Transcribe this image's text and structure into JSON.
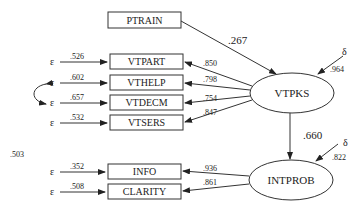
{
  "diagram": {
    "type": "structural-equation-path-diagram",
    "observed": [
      {
        "id": "ptrain",
        "label": "PTRAIN"
      },
      {
        "id": "vtpart",
        "label": "VTPART",
        "loading": ".850",
        "error_label": "ε",
        "error_value": ".526"
      },
      {
        "id": "vthelp",
        "label": "VTHELP",
        "loading": ".798",
        "error_label": "ε",
        "error_value": ".602"
      },
      {
        "id": "vtdecm",
        "label": "VTDECM",
        "loading": ".754",
        "error_label": "ε",
        "error_value": ".657"
      },
      {
        "id": "vtsers",
        "label": "VTSERS",
        "loading": ".847",
        "error_label": "ε",
        "error_value": ".532"
      },
      {
        "id": "info",
        "label": "INFO",
        "loading": ".936",
        "error_label": "ε",
        "error_value": ".352"
      },
      {
        "id": "clarity",
        "label": "CLARITY",
        "loading": ".861",
        "error_label": "ε",
        "error_value": ".508"
      }
    ],
    "latent": [
      {
        "id": "vtpks",
        "label": "VTPKS",
        "disturbance_label": "δ",
        "disturbance_value": ".964"
      },
      {
        "id": "intprob",
        "label": "INTPROB",
        "disturbance_label": "δ",
        "disturbance_value": ".822"
      }
    ],
    "paths": [
      {
        "from": "PTRAIN",
        "to": "VTPKS",
        "coef": ".267"
      },
      {
        "from": "VTPKS",
        "to": "INTPROB",
        "coef": ".660"
      }
    ],
    "correlated_errors": [
      {
        "between": [
          "VTHELP",
          "VTDECM"
        ],
        "value": ".503"
      }
    ],
    "stray_label": ".503"
  }
}
